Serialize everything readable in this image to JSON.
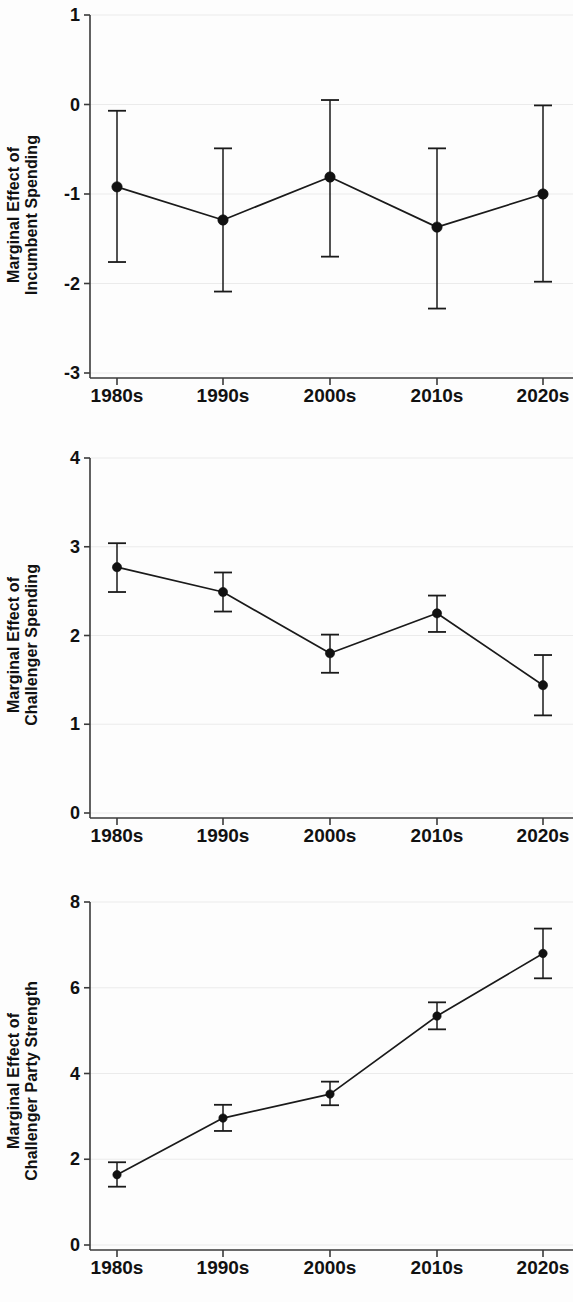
{
  "figure": {
    "background_color": "#fdfdfd",
    "ink_color": "#111111",
    "grid_color": "#ebebeb",
    "categories": [
      "1980s",
      "1990s",
      "2000s",
      "2010s",
      "2020s"
    ]
  },
  "panels": [
    {
      "id": "incumbent-spending",
      "ylabel_line1": "Marginal Effect of",
      "ylabel_line2": "Incumbent Spending",
      "yticks": [
        "1",
        "0",
        "-1",
        "-2",
        "-3"
      ],
      "xticks": [
        "1980s",
        "1990s",
        "2000s",
        "2010s",
        "2020s"
      ]
    },
    {
      "id": "challenger-spending",
      "ylabel_line1": "Marginal Effect of",
      "ylabel_line2": "Challenger Spending",
      "yticks": [
        "4",
        "3",
        "2",
        "1",
        "0"
      ],
      "xticks": [
        "1980s",
        "1990s",
        "2000s",
        "2010s",
        "2020s"
      ]
    },
    {
      "id": "challenger-party-strength",
      "ylabel_line1": "Marginal Effect of",
      "ylabel_line2": "Challenger Party Strength",
      "yticks": [
        "8",
        "6",
        "4",
        "2",
        "0"
      ],
      "xticks": [
        "1980s",
        "1990s",
        "2000s",
        "2010s",
        "2020s"
      ]
    }
  ],
  "chart_data": [
    {
      "type": "line",
      "title": "",
      "xlabel": "",
      "ylabel": "Marginal Effect of Incumbent Spending",
      "categories": [
        "1980s",
        "1990s",
        "2000s",
        "2010s",
        "2020s"
      ],
      "values": [
        -0.92,
        -1.29,
        -0.81,
        -1.37,
        -1.0
      ],
      "error_low": [
        -1.76,
        -2.09,
        -1.7,
        -2.28,
        -1.98
      ],
      "error_high": [
        -0.07,
        -0.49,
        0.05,
        -0.49,
        -0.01
      ],
      "ylim": [
        -3,
        1
      ],
      "yticks": [
        1,
        0,
        -1,
        -2,
        -3
      ],
      "grid": "horizontal",
      "legend": "none",
      "error_bars": "95% confidence interval"
    },
    {
      "type": "line",
      "title": "",
      "xlabel": "",
      "ylabel": "Marginal Effect of Challenger Spending",
      "categories": [
        "1980s",
        "1990s",
        "2000s",
        "2010s",
        "2020s"
      ],
      "values": [
        2.77,
        2.49,
        1.8,
        2.25,
        1.44
      ],
      "error_low": [
        2.49,
        2.27,
        1.58,
        2.04,
        1.1
      ],
      "error_high": [
        3.04,
        2.71,
        2.01,
        2.45,
        1.78
      ],
      "ylim": [
        0,
        4
      ],
      "yticks": [
        4,
        3,
        2,
        1,
        0
      ],
      "grid": "horizontal",
      "legend": "none",
      "error_bars": "95% confidence interval"
    },
    {
      "type": "line",
      "title": "",
      "xlabel": "",
      "ylabel": "Marginal Effect of Challenger Party Strength",
      "categories": [
        "1980s",
        "1990s",
        "2000s",
        "2010s",
        "2020s"
      ],
      "values": [
        1.64,
        2.96,
        3.52,
        5.34,
        6.8
      ],
      "error_low": [
        1.36,
        2.66,
        3.26,
        5.03,
        6.22
      ],
      "error_high": [
        1.93,
        3.27,
        3.81,
        5.66,
        7.38
      ],
      "ylim": [
        0,
        8
      ],
      "yticks": [
        8,
        6,
        4,
        2,
        0
      ],
      "grid": "horizontal",
      "legend": "none",
      "error_bars": "95% confidence interval"
    }
  ]
}
